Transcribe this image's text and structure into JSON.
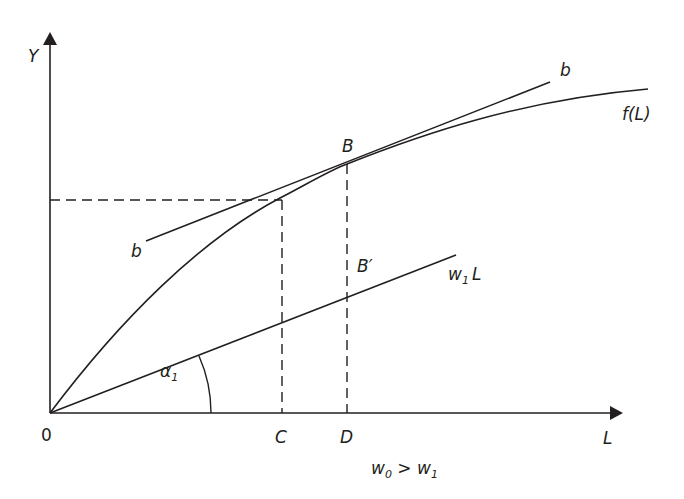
{
  "colors": {
    "ink": "#231f20",
    "background": "#ffffff"
  },
  "axes": {
    "y_label": "Y",
    "x_label": "L",
    "origin_label": "0"
  },
  "curves": {
    "production_function": {
      "label": "f(L)"
    },
    "tangent_line": {
      "label_upper": "b",
      "label_lower": "b"
    },
    "wage_line": {
      "label_main": "w",
      "label_sub": "1",
      "label_suffix": "L"
    }
  },
  "points": {
    "tangency": "B",
    "on_wage_line": "B′",
    "x_C": "C",
    "x_D": "D"
  },
  "angle": {
    "label_main": "α",
    "label_sub": "1"
  },
  "caption": {
    "w0_main": "w",
    "w0_sub": "0",
    "relation": " > ",
    "w1_main": "w",
    "w1_sub": "1"
  }
}
